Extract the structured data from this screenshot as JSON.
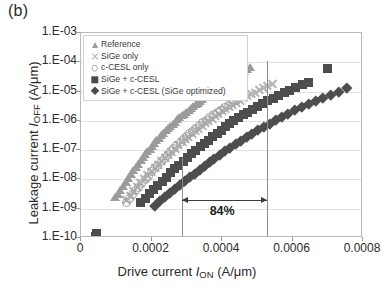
{
  "panel": {
    "label": "(b)"
  },
  "axes": {
    "ylabel_prefix": "Leakage current ",
    "ylabel_symbol": "I",
    "ylabel_sub": "OFF",
    "ylabel_units": " (A/μm)",
    "xlabel_prefix": "Drive current ",
    "xlabel_symbol": "I",
    "xlabel_sub": "ON",
    "xlabel_units": " (A/μm)",
    "yticks": [
      "1.E-03",
      "1.E-04",
      "1.E-05",
      "1.E-06",
      "1.E-07",
      "1.E-08",
      "1.E-09",
      "1.E-10"
    ],
    "xticks": [
      "0",
      "0.0002",
      "0.0004",
      "0.0006",
      "0.0008"
    ]
  },
  "legend": {
    "items": [
      {
        "label": "Reference",
        "marker": "triangle",
        "color": "#9b9b9b"
      },
      {
        "label": "SiGe only",
        "marker": "cross",
        "color": "#b0b0b0"
      },
      {
        "label": "c-CESL only",
        "marker": "circle",
        "color": "#a8a8a8"
      },
      {
        "label": "SiGe + c-CESL",
        "marker": "square",
        "color": "#4a4a4a"
      },
      {
        "label": "SiGe + c-CESL (SiGe optimized)",
        "marker": "diamond",
        "color": "#4a4a4a"
      }
    ]
  },
  "annotation": {
    "percent_label": "84%",
    "left_guide_x": 0.000287,
    "right_guide_x": 0.000528
  },
  "colors": {
    "frame": "#b9b9b9",
    "grid": "#e2e2e2",
    "text": "#2b2b2b",
    "annotation": "#3b3b3b",
    "guide": "#8d8d8d"
  },
  "chart_data": {
    "type": "scatter",
    "title": "",
    "xlabel": "Drive current I_ON (A/μm)",
    "ylabel": "Leakage current I_OFF (A/μm)",
    "xlim": [
      0,
      0.0008
    ],
    "ylim": [
      1e-10,
      0.001
    ],
    "yscale": "log",
    "xscale": "linear",
    "grid": "horizontal",
    "legend_position": "top-left-inside",
    "annotations": [
      {
        "text": "84%",
        "type": "double-arrow-span",
        "x_start": 0.000287,
        "x_end": 0.000528,
        "y": 2e-09
      }
    ],
    "series": [
      {
        "name": "Reference",
        "marker": "triangle",
        "color": "#9b9b9b",
        "x": [
          9.6e-05,
          0.000104,
          0.000112,
          0.00012,
          0.000128,
          0.000134,
          0.000141,
          0.000148,
          0.000156,
          0.000162,
          0.000169,
          0.000175,
          0.000182,
          0.000188,
          0.000195,
          0.000201,
          0.000208,
          0.000214,
          0.000221,
          0.000227,
          0.000234,
          0.00024,
          0.000247,
          0.000253,
          0.00026,
          0.000266,
          0.000273,
          0.000279,
          0.000286,
          0.000292,
          0.000299,
          0.000305,
          0.000312,
          0.000318,
          0.000325,
          0.000331,
          0.000338,
          0.000344,
          0.000351,
          0.000357,
          0.000364,
          0.00037,
          0.000377,
          0.000384,
          0.000392,
          0.000399,
          0.000407,
          0.000414,
          0.000422,
          0.00043,
          0.000438,
          0.000446,
          0.000455,
          0.000463,
          0.000471,
          0.00048
        ],
        "y": [
          2.4e-09,
          3.2e-09,
          4.4e-09,
          6e-09,
          8.2e-09,
          1.1e-08,
          1.5e-08,
          2e-08,
          2.6e-08,
          3.4e-08,
          4.4e-08,
          5.6e-08,
          7.2e-08,
          9e-08,
          1.1e-07,
          1.4e-07,
          1.7e-07,
          2.1e-07,
          2.6e-07,
          3.1e-07,
          3.8e-07,
          4.6e-07,
          5.5e-07,
          6.6e-07,
          7.8e-07,
          9.2e-07,
          1.1e-06,
          1.3e-06,
          1.5e-06,
          1.7e-06,
          2e-06,
          2.3e-06,
          2.7e-06,
          3.1e-06,
          3.6e-06,
          4.1e-06,
          4.7e-06,
          5.4e-06,
          6.2e-06,
          7e-06,
          8e-06,
          9.1e-06,
          1e-05,
          1.2e-05,
          1.4e-05,
          1.6e-05,
          1.9e-05,
          2.2e-05,
          2.6e-05,
          3e-05,
          3.4e-05,
          3.9e-05,
          4.5e-05,
          5.1e-05,
          5.8e-05,
          6.6e-05
        ]
      },
      {
        "name": "SiGe only",
        "marker": "cross",
        "color": "#b0b0b0",
        "x": [
          0.00013,
          0.00014,
          0.00015,
          0.00016,
          0.00017,
          0.00018,
          0.00019,
          0.0002,
          0.00021,
          0.000219,
          0.000229,
          0.000239,
          0.000248,
          0.000258,
          0.000268,
          0.000277,
          0.000287,
          0.000296,
          0.000306,
          0.000315,
          0.000325,
          0.000334,
          0.000344,
          0.000353,
          0.000363,
          0.000372,
          0.000382,
          0.000391,
          0.000401,
          0.000411,
          0.000421,
          0.000431,
          0.000441,
          0.000452,
          0.000462,
          0.000473,
          0.000484,
          0.000495,
          0.000507,
          0.000518,
          0.00053,
          0.000542
        ],
        "y": [
          2.1e-09,
          3e-09,
          4.2e-09,
          5.8e-09,
          8e-09,
          1.1e-08,
          1.5e-08,
          2e-08,
          2.7e-08,
          3.5e-08,
          4.6e-08,
          5.9e-08,
          7.6e-08,
          9.7e-08,
          1.2e-07,
          1.6e-07,
          2e-07,
          2.5e-07,
          3.1e-07,
          3.9e-07,
          4.8e-07,
          5.9e-07,
          7.2e-07,
          8.8e-07,
          1.1e-06,
          1.3e-06,
          1.6e-06,
          1.9e-06,
          2.3e-06,
          2.7e-06,
          3.2e-06,
          3.8e-06,
          4.5e-06,
          5.3e-06,
          6.3e-06,
          7.4e-06,
          8.7e-06,
          1e-05,
          1.2e-05,
          1.4e-05,
          1.7e-05,
          2e-05
        ]
      },
      {
        "name": "c-CESL only",
        "marker": "circle",
        "color": "#a8a8a8",
        "x": [
          0.000128,
          0.000137,
          0.000146,
          0.000155,
          0.000164,
          0.000173,
          0.000182,
          0.000191,
          0.0002,
          0.000209,
          0.000218,
          0.000227,
          0.000236,
          0.000245,
          0.000254,
          0.000263,
          0.000272,
          0.000281,
          0.00029,
          0.000299,
          0.000308,
          0.000317,
          0.000326,
          0.000336,
          0.000345,
          0.000355,
          0.000365,
          0.000375,
          0.000386,
          0.000396,
          0.000407,
          0.000418,
          0.00043,
          0.000442
        ],
        "y": [
          1.6e-09,
          2.2e-09,
          3e-09,
          4.1e-09,
          5.5e-09,
          7.4e-09,
          1e-08,
          1.3e-08,
          1.8e-08,
          2.3e-08,
          3e-08,
          4e-08,
          5.2e-08,
          6.7e-08,
          8.7e-08,
          1.1e-07,
          1.4e-07,
          1.8e-07,
          2.3e-07,
          2.9e-07,
          3.6e-07,
          4.5e-07,
          5.6e-07,
          6.9e-07,
          8.5e-07,
          1e-06,
          1.3e-06,
          1.6e-06,
          1.9e-06,
          2.3e-06,
          2.8e-06,
          3.4e-06,
          4.1e-06,
          4.9e-06
        ]
      },
      {
        "name": "SiGe + c-CESL",
        "marker": "square",
        "color": "#4d4d4d",
        "x": [
          4e-05,
          4.4e-05,
          0.00017,
          0.000182,
          0.000194,
          0.000206,
          0.000218,
          0.00023,
          0.000242,
          0.000254,
          0.000266,
          0.000278,
          0.00029,
          0.000302,
          0.000314,
          0.000326,
          0.000338,
          0.00035,
          0.000362,
          0.000374,
          0.000386,
          0.000398,
          0.00041,
          0.000422,
          0.000434,
          0.000447,
          0.00046,
          0.000473,
          0.000487,
          0.000501,
          0.000515,
          0.00053,
          0.000545,
          0.00056,
          0.000576,
          0.000592,
          0.000609,
          0.000627,
          0.000646,
          0.0007
        ],
        "y": [
          1.1e-10,
          1.4e-10,
          1.6e-09,
          2.3e-09,
          3.2e-09,
          4.5e-09,
          6.3e-09,
          8.8e-09,
          1.2e-08,
          1.7e-08,
          2.3e-08,
          3.1e-08,
          4.2e-08,
          5.6e-08,
          7.5e-08,
          1e-07,
          1.3e-07,
          1.7e-07,
          2.2e-07,
          2.9e-07,
          3.7e-07,
          4.8e-07,
          6.2e-07,
          7.9e-07,
          1e-06,
          1.3e-06,
          1.6e-06,
          2e-06,
          2.5e-06,
          3.1e-06,
          3.9e-06,
          4.8e-06,
          6e-06,
          7.4e-06,
          9.1e-06,
          1.1e-05,
          1.4e-05,
          1.7e-05,
          2.1e-05,
          6e-05
        ]
      },
      {
        "name": "SiGe + c-CESL (SiGe optimized)",
        "marker": "diamond",
        "color": "#4d4d4d",
        "x": [
          0.00021,
          0.000224,
          0.000238,
          0.000252,
          0.000266,
          0.00028,
          0.000294,
          0.000308,
          0.000322,
          0.000336,
          0.00035,
          0.000364,
          0.000378,
          0.000393,
          0.000408,
          0.000423,
          0.000438,
          0.000453,
          0.000469,
          0.000485,
          0.000501,
          0.000518,
          0.000535,
          0.000552,
          0.00057,
          0.000588,
          0.000607,
          0.000626,
          0.000646,
          0.000666,
          0.000687,
          0.000709,
          0.000731,
          0.000754
        ],
        "y": [
          1.3e-09,
          1.8e-09,
          2.5e-09,
          3.4e-09,
          4.7e-09,
          6.4e-09,
          8.7e-09,
          1.2e-08,
          1.6e-08,
          2.2e-08,
          2.9e-08,
          3.9e-08,
          5.2e-08,
          7e-08,
          9.3e-08,
          1.2e-07,
          1.6e-07,
          2.1e-07,
          2.8e-07,
          3.7e-07,
          4.8e-07,
          6.3e-07,
          8.2e-07,
          1.1e-06,
          1.4e-06,
          1.8e-06,
          2.3e-06,
          3e-06,
          3.8e-06,
          4.9e-06,
          6.3e-06,
          8e-06,
          1e-05,
          1.3e-05
        ]
      }
    ]
  }
}
